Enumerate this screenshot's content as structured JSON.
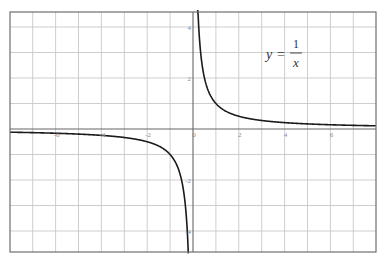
{
  "chart_data": {
    "type": "line",
    "title": "",
    "function": "y = 1/x",
    "annotation": {
      "lhs": "y",
      "equals": "=",
      "numerator": "1",
      "denominator": "x"
    },
    "xlabel": "",
    "ylabel": "",
    "xlim": [
      -8,
      8
    ],
    "ylim": [
      -4.8,
      4.6
    ],
    "x_ticks": [
      -6,
      -4,
      -2,
      0,
      2,
      4,
      6
    ],
    "x_tick_labels": [
      "-6",
      "-4",
      "-2",
      "0",
      "2",
      "4",
      "6"
    ],
    "y_ticks": [
      -4,
      -2,
      2,
      4
    ],
    "y_tick_labels": [
      "-4",
      "-2",
      "2",
      "4"
    ],
    "grid": true,
    "grid_step": {
      "x": 1,
      "y": 1
    },
    "legend": null,
    "series": [
      {
        "name": "y = 1/x (x > 0)",
        "x": [
          0.22,
          0.25,
          0.3,
          0.4,
          0.5,
          0.75,
          1,
          1.5,
          2,
          3,
          4,
          5,
          6,
          7,
          8
        ],
        "y": [
          4.55,
          4,
          3.33,
          2.5,
          2,
          1.33,
          1,
          0.67,
          0.5,
          0.33,
          0.25,
          0.2,
          0.17,
          0.14,
          0.125
        ]
      },
      {
        "name": "y = 1/x (x < 0)",
        "x": [
          -8,
          -7,
          -6,
          -5,
          -4,
          -3,
          -2,
          -1.5,
          -1,
          -0.75,
          -0.5,
          -0.4,
          -0.3,
          -0.25,
          -0.21
        ],
        "y": [
          -0.125,
          -0.14,
          -0.17,
          -0.2,
          -0.25,
          -0.33,
          -0.5,
          -0.67,
          -1,
          -1.33,
          -2,
          -2.5,
          -3.33,
          -4,
          -4.76
        ]
      }
    ],
    "colors": {
      "curve": "#1a1a1a",
      "grid": "#c8c8c8",
      "axis": "#666666",
      "border": "#6e6e6e",
      "tick_label": "#8a8a8a"
    }
  }
}
